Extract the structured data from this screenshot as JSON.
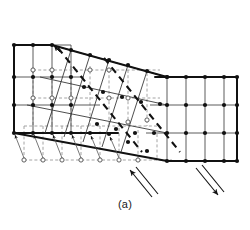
{
  "figure": {
    "caption": "(a)",
    "colors": {
      "lattice_line": "#1a1a1a",
      "reference_dashed": "#9a9a9a",
      "node_fill": "#111111",
      "open_node_stroke": "#4d4d4d",
      "background": "#ffffff"
    },
    "geometry": {
      "left_grid": {
        "columns_x": [
          14,
          33,
          52,
          71
        ],
        "rows_y": [
          45,
          77,
          105,
          133
        ],
        "note": "undeformed rectangular lattice, upper-left block"
      },
      "right_grid": {
        "columns_x": [
          167,
          186,
          205,
          224,
          237
        ],
        "rows_y": [
          77,
          105,
          133,
          161
        ],
        "note": "undeformed rectangular lattice, lower-right block, shifted down one row"
      },
      "shear_band": {
        "top_edge": [
          [
            52,
            45
          ],
          [
            167,
            77
          ]
        ],
        "bottom_edge": [
          [
            14,
            133
          ],
          [
            167,
            161
          ]
        ],
        "note": "rotated lattice band connecting the two blocks"
      },
      "reference_dashed_grid": {
        "columns_x": [
          24,
          43,
          62,
          81,
          100,
          119,
          138,
          157
        ],
        "rows_y": [
          70,
          98,
          126,
          160
        ],
        "note": "dashed undeformed reference lattice with open circle sites"
      },
      "bold_dashed_shear_lines": [
        [
          [
            60,
            50
          ],
          [
            140,
            148
          ]
        ],
        [
          [
            105,
            60
          ],
          [
            178,
            150
          ]
        ]
      ],
      "displacement_arrows": {
        "count": 6,
        "from_row_y": 160,
        "to_row_y": 133,
        "direction": "up-left",
        "note": "arrows from open circle original sites to filled displaced nodes"
      }
    },
    "shear_markers": [
      {
        "name": "left-shear-arrow",
        "direction": "up-left",
        "tail": [
          152,
          198
        ],
        "head": [
          128,
          168
        ]
      },
      {
        "name": "right-shear-arrow",
        "direction": "down-right",
        "tail": [
          196,
          168
        ],
        "head": [
          222,
          196
        ]
      }
    ]
  }
}
